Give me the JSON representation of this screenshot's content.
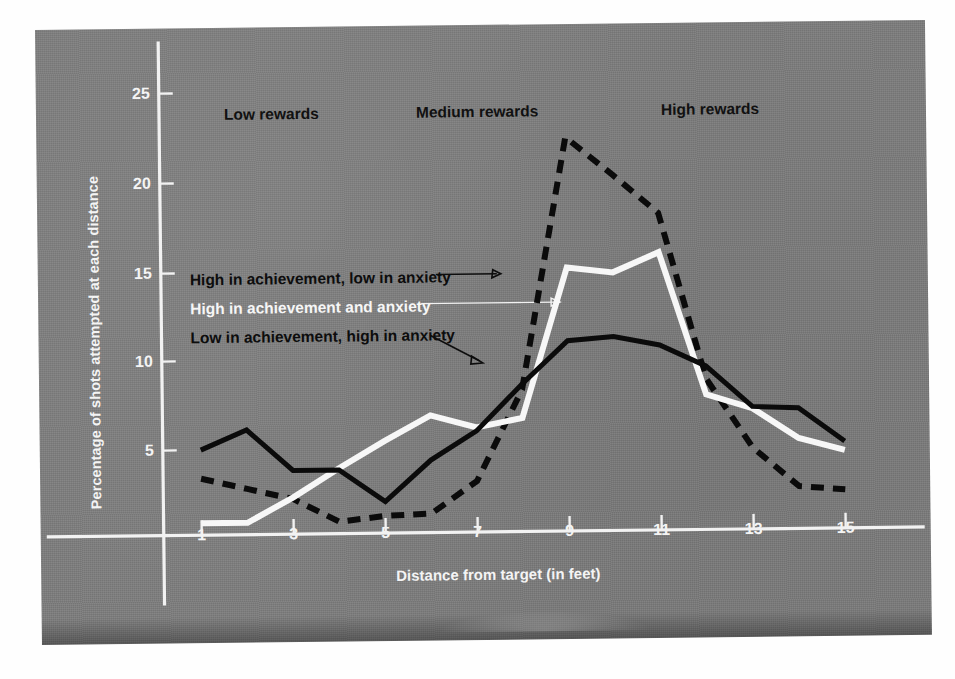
{
  "chart_data": {
    "type": "line",
    "title": "",
    "xlabel": "Distance from target (in feet)",
    "ylabel": "Percentage of shots attempted at each distance",
    "x": [
      1,
      2,
      3,
      4,
      5,
      6,
      7,
      8,
      9,
      10,
      11,
      12,
      13,
      14,
      15
    ],
    "xticks": [
      1,
      3,
      5,
      7,
      9,
      11,
      13,
      15
    ],
    "xticklabels": [
      "1",
      "3",
      "5",
      "7",
      "9",
      "11",
      "13",
      "15"
    ],
    "yticks": [
      5,
      10,
      15,
      20,
      25
    ],
    "yticklabels": [
      "5",
      "10",
      "15",
      "20",
      "25"
    ],
    "xlim": [
      0.6,
      15.6
    ],
    "ylim": [
      0,
      26.5
    ],
    "grid": false,
    "legend_position": "inline-annotations",
    "series": [
      {
        "name": "High in achievement, low in anxiety",
        "style": "dashed",
        "color": "#0b0b0b",
        "values": [
          3.4,
          2.8,
          2.2,
          0.9,
          1.2,
          1.3,
          3.1,
          8.2,
          22.3,
          20.2,
          18.0,
          8.7,
          4.8,
          2.6,
          2.4
        ]
      },
      {
        "name": "High in achievement and anxiety",
        "style": "solid-white",
        "color": "#f7f7f7",
        "values": [
          0.9,
          0.9,
          2.3,
          3.9,
          5.4,
          6.8,
          6.1,
          6.6,
          15.0,
          14.7,
          15.8,
          7.8,
          7.0,
          5.3,
          4.6
        ]
      },
      {
        "name": "Low in achievement, high in anxiety",
        "style": "solid-black",
        "color": "#0b0b0b",
        "values": [
          5.0,
          6.1,
          3.8,
          3.8,
          2.0,
          4.3,
          5.9,
          8.5,
          10.9,
          11.1,
          10.6,
          9.4,
          7.1,
          7.0,
          5.1
        ]
      }
    ],
    "annotations": [
      {
        "text": "Low rewards",
        "x_center": 4.0,
        "y": 24.0
      },
      {
        "text": "Medium rewards",
        "x_center": 8.6,
        "y": 24.0
      },
      {
        "text": "High rewards",
        "x_center": 13.0,
        "y": 24.0
      }
    ]
  },
  "axis": {
    "ylabel": "Percentage of shots attempted at each distance",
    "xlabel": "Distance from target (in feet)",
    "yticklabels": [
      "25",
      "20",
      "15",
      "10",
      "5"
    ],
    "xticklabels": [
      "1",
      "3",
      "5",
      "7",
      "9",
      "11",
      "13",
      "15"
    ]
  },
  "regions": {
    "low": "Low rewards",
    "medium": "Medium rewards",
    "high": "High rewards"
  },
  "legend": {
    "line1": "High in achievement, low in anxiety",
    "line2": "High in achievement and anxiety",
    "line3": "Low in achievement, high in anxiety"
  },
  "colors": {
    "background": "#7d7d7d",
    "axis": "#f2f2f2",
    "dark_series": "#0b0b0b",
    "light_series": "#f7f7f7",
    "page": "#ffffff"
  }
}
